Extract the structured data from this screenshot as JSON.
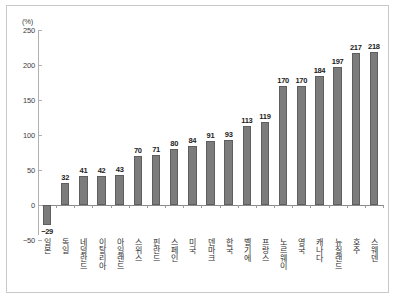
{
  "chart_data": {
    "type": "bar",
    "title": "",
    "subtitle": "",
    "xlabel": "",
    "ylabel": "",
    "unit_label": "(%)",
    "ylim": [
      -50,
      250
    ],
    "yticks": [
      250,
      200,
      150,
      100,
      50,
      0,
      -50
    ],
    "ytick_labels": [
      "250",
      "200",
      "150",
      "100",
      "50",
      "0",
      "-50"
    ],
    "grid": false,
    "legend": "none",
    "categories": [
      "일본",
      "독일",
      "네덜란드",
      "이탈리아",
      "아일랜드",
      "스위스",
      "핀란드",
      "스페인",
      "미국",
      "덴마크",
      "한국",
      "벨기에",
      "프랑스",
      "노르웨이",
      "영국",
      "캐나다",
      "뉴질랜드",
      "호주",
      "스웨덴"
    ],
    "values": [
      -29,
      32,
      41,
      42,
      43,
      70,
      71,
      80,
      84,
      91,
      93,
      113,
      119,
      170,
      170,
      184,
      197,
      217,
      218
    ],
    "value_labels": [
      "-29",
      "32",
      "41",
      "42",
      "43",
      "70",
      "71",
      "80",
      "84",
      "91",
      "93",
      "113",
      "119",
      "170",
      "170",
      "184",
      "197",
      "217",
      "218"
    ],
    "bar_color": "#7c7c7c",
    "bar_border_color": "#5e5e5e",
    "axis_color": "#8a8a8a",
    "frame_color": "#c9c9c9",
    "text_color": "#2e2e2e"
  }
}
